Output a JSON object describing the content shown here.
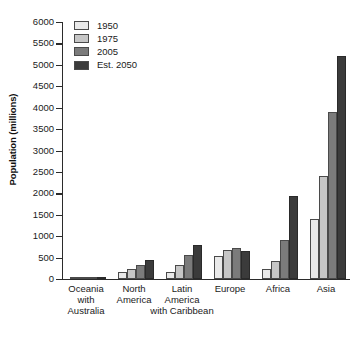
{
  "chart_data": {
    "type": "bar",
    "title": "",
    "subtitle": "",
    "xlabel": "",
    "ylabel": "Population (millions)",
    "ylim": [
      0,
      6000
    ],
    "ytick_step": 500,
    "yticks": [
      6000,
      5500,
      5000,
      4500,
      4000,
      3500,
      3000,
      2500,
      2000,
      1500,
      1000,
      500,
      0
    ],
    "ytick_labels": [
      "6000",
      "5500",
      "5000",
      "4500",
      "4000",
      "3500",
      "3000",
      "2500",
      "2000",
      "1500",
      "1000",
      "500",
      "0"
    ],
    "grid": false,
    "legend_position": "top-left",
    "categories": [
      "Oceania\nwith\nAustralia",
      "North\nAmerica",
      "Latin\nAmerica\nwith Caribbean",
      "Europe",
      "Africa",
      "Asia"
    ],
    "series": [
      {
        "name": "1950",
        "color": "#e9e9e9",
        "values": [
          13,
          172,
          167,
          547,
          224,
          1396
        ]
      },
      {
        "name": "1975",
        "color": "#c6c6c6",
        "values": [
          21,
          243,
          322,
          676,
          416,
          2394
        ]
      },
      {
        "name": "2005",
        "color": "#7b7b7b",
        "values": [
          33,
          331,
          561,
          728,
          906,
          3905
        ]
      },
      {
        "name": "Est. 2050",
        "color": "#3b3b3b",
        "values": [
          48,
          438,
          783,
          653,
          1937,
          5217
        ]
      }
    ]
  },
  "legend": {
    "items": [
      {
        "label": "1950"
      },
      {
        "label": "1975"
      },
      {
        "label": "2005"
      },
      {
        "label": "Est. 2050"
      }
    ]
  },
  "colors": {
    "series_1950": "#e9e9e9",
    "series_1975": "#c6c6c6",
    "series_2005": "#7b7b7b",
    "series_est_2050": "#3b3b3b",
    "axis": "#2b2b2b",
    "background": "#ffffff",
    "text": "#1a1a1a"
  }
}
